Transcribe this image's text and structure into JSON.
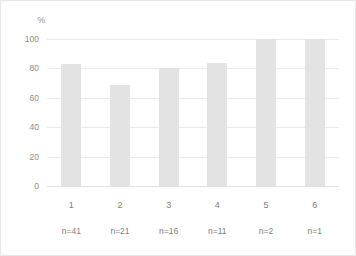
{
  "chart_data": {
    "type": "bar",
    "title": "",
    "subtitle": "",
    "xlabel": "",
    "ylabel": "%",
    "y_unit_label": "%",
    "categories": [
      "1",
      "2",
      "3",
      "4",
      "5",
      "6"
    ],
    "values": [
      83,
      69,
      80,
      84,
      100,
      100
    ],
    "group_sizes": [
      "n=41",
      "n=21",
      "n=16",
      "n=11",
      "n=2",
      "n=1"
    ],
    "group_size_values": [
      41,
      21,
      16,
      11,
      2,
      1
    ],
    "ylim": [
      0,
      100
    ],
    "yticks": [
      0,
      20,
      40,
      60,
      80,
      100
    ],
    "ytick_labels": [
      "0",
      "20",
      "40",
      "60",
      "80",
      "100"
    ],
    "grid": true,
    "grid_axis": "y",
    "legend": false,
    "legend_position": "none",
    "annotations": [],
    "colors": {
      "bar": "#e3e3e3",
      "gridline": "#e9e9e9",
      "baseline": "#e0e0e0",
      "tick_text": "#8c8c8c",
      "axis_text": "#7d7d7d",
      "background": "#ffffff",
      "figure_border": "#e8e8e8"
    }
  }
}
